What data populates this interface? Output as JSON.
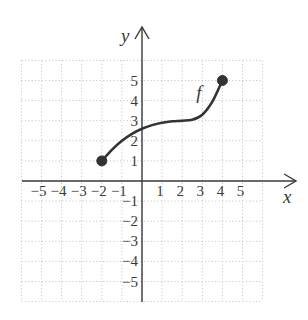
{
  "chart_data": {
    "type": "line",
    "title": "",
    "xlabel": "x",
    "ylabel": "y",
    "xlim": [
      -6,
      6
    ],
    "ylim": [
      -6,
      6
    ],
    "grid": true,
    "grid_style": "dotted",
    "x_ticks": [
      -5,
      -4,
      -3,
      -2,
      -1,
      1,
      2,
      3,
      4,
      5
    ],
    "y_ticks": [
      -5,
      -4,
      -3,
      -2,
      -1,
      1,
      2,
      3,
      4,
      5
    ],
    "x_tick_labels": [
      "−5",
      "−4",
      "−3",
      "−2",
      "−1",
      "1",
      "2",
      "3",
      "4",
      "5"
    ],
    "y_tick_labels": [
      "−5",
      "−4",
      "−3",
      "−2",
      "−1",
      "1",
      "2",
      "3",
      "4",
      "5"
    ],
    "series": [
      {
        "name": "f",
        "label": "f",
        "label_position": [
          2.7,
          4.4
        ],
        "points": [
          [
            -2,
            1
          ],
          [
            -1.5,
            1.55
          ],
          [
            -1,
            2.0
          ],
          [
            -0.5,
            2.35
          ],
          [
            0,
            2.6
          ],
          [
            0.5,
            2.78
          ],
          [
            1,
            2.9
          ],
          [
            1.5,
            2.97
          ],
          [
            2,
            3.0
          ],
          [
            2.5,
            3.05
          ],
          [
            3,
            3.3
          ],
          [
            3.5,
            3.95
          ],
          [
            4,
            5
          ]
        ],
        "endpoints": [
          {
            "x": -2,
            "y": 1,
            "style": "closed"
          },
          {
            "x": 4,
            "y": 5,
            "style": "closed"
          }
        ],
        "domain": [
          -2,
          4
        ],
        "range": [
          1,
          5
        ]
      }
    ],
    "colors": {
      "curve": "#333333",
      "axes": "#3a3a3a",
      "grid": "#c8c8c8",
      "text": "#3a3a3a"
    }
  }
}
